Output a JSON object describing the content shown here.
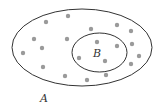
{
  "diagram": {
    "type": "venn-subset",
    "colors": {
      "line": "#333333",
      "dot": "#9a9a9a",
      "background": "#ffffff"
    },
    "sets": [
      {
        "id": "A",
        "label": "A",
        "cx": 82,
        "cy": 47.5,
        "rx": 70,
        "ry": 38.5,
        "label_x": 40,
        "label_y": 102
      },
      {
        "id": "B",
        "label": "B",
        "cx": 99.5,
        "cy": 52.5,
        "rx": 27.5,
        "ry": 19.5,
        "label_x": 93,
        "label_y": 57
      }
    ],
    "elements": [
      {
        "x": 68,
        "y": 16
      },
      {
        "x": 46,
        "y": 22
      },
      {
        "x": 91,
        "y": 29
      },
      {
        "x": 117,
        "y": 25
      },
      {
        "x": 131,
        "y": 31
      },
      {
        "x": 34,
        "y": 39
      },
      {
        "x": 67,
        "y": 39
      },
      {
        "x": 97,
        "y": 42
      },
      {
        "x": 117,
        "y": 46
      },
      {
        "x": 132,
        "y": 44
      },
      {
        "x": 42,
        "y": 48
      },
      {
        "x": 23,
        "y": 53
      },
      {
        "x": 79,
        "y": 58
      },
      {
        "x": 105,
        "y": 61
      },
      {
        "x": 139,
        "y": 56
      },
      {
        "x": 43,
        "y": 67
      },
      {
        "x": 131,
        "y": 64
      },
      {
        "x": 65,
        "y": 76
      },
      {
        "x": 87,
        "y": 80
      },
      {
        "x": 106,
        "y": 75
      }
    ]
  }
}
